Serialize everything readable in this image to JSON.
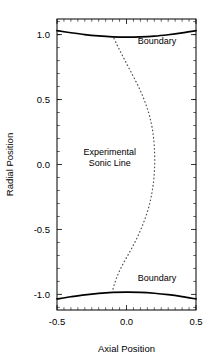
{
  "chart_data": {
    "type": "line",
    "title": "",
    "xlabel": "Axial Position",
    "ylabel": "Radial Position",
    "xlim": [
      -0.5,
      0.5
    ],
    "ylim": [
      -1.12,
      1.12
    ],
    "xticks": [
      -0.5,
      0.0,
      0.5
    ],
    "xticklabels": [
      "-0.5",
      "0.0",
      "0.5"
    ],
    "yticks": [
      1.0,
      0.5,
      0.0,
      -0.5,
      -1.0
    ],
    "yticklabels": [
      "1.0",
      "0.5",
      "0.0",
      "-0.5",
      "-1.0"
    ],
    "grid": false,
    "legend": "none",
    "minor_ticks": true,
    "series": [
      {
        "name": "Upper Boundary",
        "style": "solid",
        "color": "#000000",
        "x": [
          -0.5,
          -0.4,
          -0.3,
          -0.2,
          -0.1,
          0.0,
          0.1,
          0.2,
          0.3,
          0.4,
          0.5
        ],
        "y": [
          1.03,
          1.014,
          1.0,
          0.99,
          0.983,
          0.98,
          0.982,
          0.988,
          0.999,
          1.013,
          1.03
        ]
      },
      {
        "name": "Lower Boundary",
        "style": "solid",
        "color": "#000000",
        "x": [
          -0.5,
          -0.4,
          -0.3,
          -0.2,
          -0.1,
          0.0,
          0.1,
          0.2,
          0.3,
          0.4,
          0.5
        ],
        "y": [
          -1.035,
          -1.018,
          -1.003,
          -0.992,
          -0.985,
          -0.982,
          -0.984,
          -0.991,
          -1.002,
          -1.017,
          -1.035
        ]
      },
      {
        "name": "Experimental Sonic Line",
        "style": "dotted",
        "color": "#555555",
        "x": [
          -0.09,
          -0.07,
          -0.048,
          -0.025,
          -0.002,
          0.022,
          0.046,
          0.07,
          0.093,
          0.114,
          0.133,
          0.15,
          0.165,
          0.177,
          0.187,
          0.194,
          0.199,
          0.202,
          0.203,
          0.202,
          0.199,
          0.194,
          0.186,
          0.176,
          0.163,
          0.147,
          0.128,
          0.107,
          0.084,
          0.059,
          0.033,
          0.006,
          -0.021,
          -0.047,
          -0.07,
          -0.088,
          -0.1
        ],
        "y": [
          0.97,
          0.925,
          0.878,
          0.83,
          0.782,
          0.733,
          0.684,
          0.634,
          0.584,
          0.533,
          0.482,
          0.43,
          0.377,
          0.323,
          0.268,
          0.212,
          0.155,
          0.097,
          0.038,
          -0.021,
          -0.08,
          -0.139,
          -0.198,
          -0.257,
          -0.316,
          -0.375,
          -0.433,
          -0.49,
          -0.546,
          -0.601,
          -0.654,
          -0.706,
          -0.757,
          -0.812,
          -0.869,
          -0.925,
          -0.97
        ]
      }
    ],
    "annotations": [
      {
        "name": "boundary-label-top",
        "text": "Boundary",
        "x": 0.22,
        "y": 0.93
      },
      {
        "name": "boundary-label-bottom",
        "text": "Boundary",
        "x": 0.22,
        "y": -0.9
      },
      {
        "name": "sonic-line-label-line1",
        "text": "Experimental",
        "x": -0.12,
        "y": 0.075
      },
      {
        "name": "sonic-line-label-line2",
        "text": "Sonic Line",
        "x": -0.12,
        "y": -0.015
      }
    ]
  }
}
